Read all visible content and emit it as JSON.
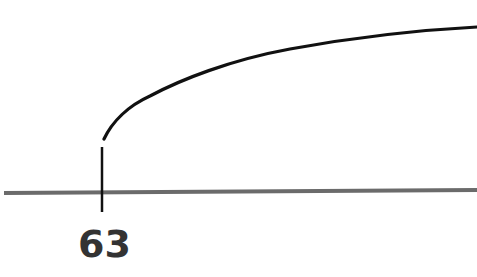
{
  "diagram": {
    "type": "number-line-with-curve",
    "axis": {
      "color": "#6b6b6b",
      "thickness": 4
    },
    "tick": {
      "label": "63",
      "color": "#111111"
    },
    "curve": {
      "color": "#111111",
      "description": "concave-down increasing curve starting just above the 63 tick and rising toward the right edge"
    },
    "label_color": "#333333"
  }
}
